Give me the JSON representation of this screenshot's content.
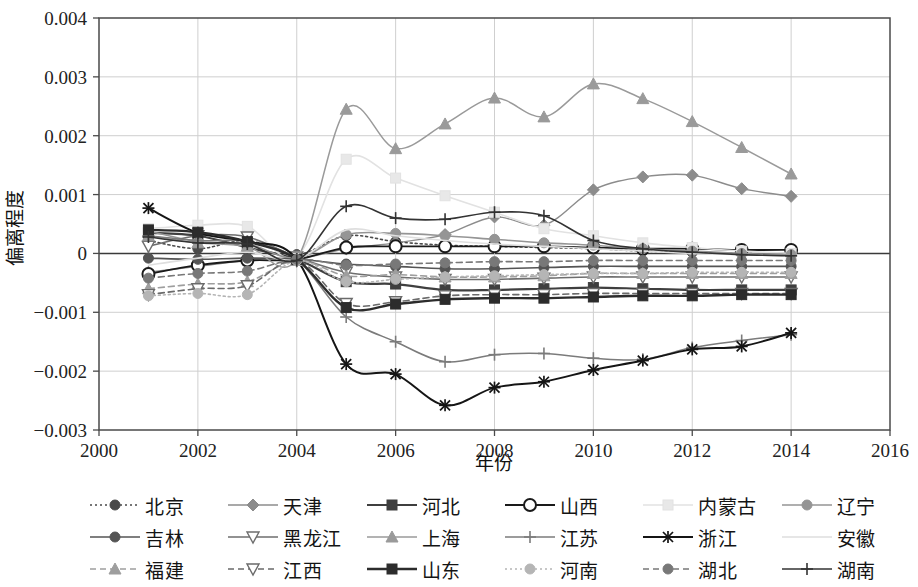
{
  "chart_data": {
    "type": "line",
    "title": "",
    "xlabel": "年份",
    "ylabel": "偏离程度",
    "xlim": [
      2000,
      2016
    ],
    "ylim": [
      -0.003,
      0.004
    ],
    "xticks": [
      "2000",
      "2002",
      "2004",
      "2006",
      "2008",
      "2010",
      "2012",
      "2014",
      "2016"
    ],
    "yticks": [
      "0.004",
      "0.003",
      "0.002",
      "0.001",
      "0",
      "-0.001",
      "-0.002",
      "-0.003"
    ],
    "grid": true,
    "legend_position": "bottom",
    "x": [
      2001,
      2002,
      2003,
      2004,
      2005,
      2006,
      2007,
      2008,
      2009,
      2010,
      2011,
      2012,
      2013,
      2014
    ],
    "series": [
      {
        "name": "北京",
        "color": "#4a4a4a",
        "dash": "2,3",
        "marker": "circle",
        "marker_fill": "#4a4a4a",
        "width": 1.6,
        "values": [
          0.00022,
          8e-05,
          0.00022,
          -2e-05,
          0.0003,
          0.0002,
          0.00014,
          0.00012,
          0.0001,
          8e-05,
          4e-05,
          2e-05,
          0.0,
          -2e-05
        ]
      },
      {
        "name": "天津",
        "color": "#8c8c8c",
        "dash": "none",
        "marker": "diamond",
        "marker_fill": "#8c8c8c",
        "width": 1.4,
        "values": [
          -0.00032,
          -0.00022,
          -0.00012,
          -0.0001,
          8e-05,
          0.00018,
          0.00032,
          0.00062,
          0.00048,
          0.00108,
          0.0013,
          0.00133,
          0.0011,
          0.00097
        ]
      },
      {
        "name": "河北",
        "color": "#3f3f3f",
        "dash": "none",
        "marker": "square",
        "marker_fill": "#3f3f3f",
        "width": 2.2,
        "values": [
          0.00035,
          0.0003,
          0.0001,
          -0.0001,
          -0.00048,
          -0.00052,
          -0.00062,
          -0.00062,
          -0.0006,
          -0.00058,
          -0.0006,
          -0.00062,
          -0.00062,
          -0.00062
        ]
      },
      {
        "name": "山西",
        "color": "#1a1a1a",
        "dash": "none",
        "marker": "circle-open",
        "marker_fill": "#ffffff",
        "width": 1.8,
        "values": [
          -0.00035,
          -0.0002,
          -0.00012,
          -0.0001,
          0.0001,
          0.00012,
          0.00012,
          0.00012,
          0.00012,
          0.0001,
          8e-05,
          8e-05,
          6e-05,
          6e-05
        ]
      },
      {
        "name": "内蒙古",
        "color": "#e2e2e2",
        "dash": "none",
        "marker": "square",
        "marker_fill": "#e8e8e8",
        "width": 1.6,
        "values": [
          0.00042,
          0.00048,
          0.00046,
          -5e-05,
          0.0016,
          0.00128,
          0.00098,
          0.0007,
          0.00042,
          0.0003,
          0.00018,
          0.0001,
          4e-05,
          0.0
        ]
      },
      {
        "name": "辽宁",
        "color": "#959595",
        "dash": "none",
        "marker": "circle",
        "marker_fill": "#959595",
        "width": 1.6,
        "values": [
          0.00038,
          0.0002,
          0.00016,
          -8e-05,
          0.00032,
          0.00034,
          0.0003,
          0.00024,
          0.00018,
          0.00014,
          8e-05,
          4e-05,
          0.0,
          -2e-05
        ]
      },
      {
        "name": "吉林",
        "color": "#545454",
        "dash": "none",
        "marker": "circle",
        "marker_fill": "#545454",
        "width": 1.6,
        "values": [
          -8e-05,
          -0.0001,
          -8e-05,
          -0.0001,
          -0.00018,
          -0.00022,
          -0.00026,
          -0.00026,
          -0.00024,
          -0.00022,
          -0.00022,
          -0.00022,
          -0.00022,
          -0.00022
        ]
      },
      {
        "name": "黑龙江",
        "color": "#6e6e6e",
        "dash": "none",
        "marker": "triangle-down-open",
        "marker_fill": "#ffffff",
        "width": 1.6,
        "values": [
          0.00012,
          0.0003,
          0.00028,
          -6e-05,
          -0.00032,
          -0.0004,
          -0.00044,
          -0.00044,
          -0.00042,
          -0.0004,
          -0.0004,
          -0.0004,
          -0.0004,
          -0.0004
        ]
      },
      {
        "name": "上海",
        "color": "#9a9a9a",
        "dash": "none",
        "marker": "triangle",
        "marker_fill": "#9a9a9a",
        "width": 1.5,
        "values": [
          0.0003,
          0.00018,
          0.00012,
          -0.0001,
          0.00245,
          0.00178,
          0.0022,
          0.00264,
          0.00232,
          0.00288,
          0.00263,
          0.00224,
          0.0018,
          0.00135
        ]
      },
      {
        "name": "江苏",
        "color": "#7b7b7b",
        "dash": "none",
        "marker": "plus",
        "marker_fill": "#7b7b7b",
        "width": 1.5,
        "values": [
          0.0003,
          0.00022,
          0.0002,
          -0.0001,
          -0.00108,
          -0.0015,
          -0.00184,
          -0.00172,
          -0.0017,
          -0.00178,
          -0.0018,
          -0.0016,
          -0.00148,
          -0.00138
        ]
      },
      {
        "name": "浙江",
        "color": "#151515",
        "dash": "none",
        "marker": "star",
        "marker_fill": "#151515",
        "width": 2.0,
        "values": [
          0.00077,
          0.00035,
          0.0002,
          -0.0001,
          -0.00188,
          -0.00205,
          -0.00258,
          -0.00228,
          -0.00218,
          -0.00198,
          -0.00182,
          -0.00163,
          -0.00158,
          -0.00135
        ]
      },
      {
        "name": "安徽",
        "color": "#dedede",
        "dash": "none",
        "marker": "none",
        "marker_fill": "#dedede",
        "width": 1.6,
        "values": [
          -0.0002,
          -8e-05,
          2e-05,
          -0.0001,
          0.0004,
          0.0003,
          0.00022,
          0.00016,
          0.00012,
          8e-05,
          4e-05,
          0.0,
          -2e-05,
          -4e-05
        ]
      },
      {
        "name": "福建",
        "color": "#9e9e9e",
        "dash": "6,4",
        "marker": "triangle",
        "marker_fill": "#9e9e9e",
        "width": 1.6,
        "values": [
          -0.0006,
          -0.00052,
          -0.00048,
          -0.00012,
          -0.00038,
          -0.00036,
          -0.0004,
          -0.0004,
          -0.00038,
          -0.00034,
          -0.00034,
          -0.00034,
          -0.00034,
          -0.00034
        ]
      },
      {
        "name": "江西",
        "color": "#6a6a6a",
        "dash": "6,4",
        "marker": "triangle-down-open",
        "marker_fill": "#ffffff",
        "width": 1.6,
        "values": [
          -0.0007,
          -0.0006,
          -0.00055,
          -0.00012,
          -0.00085,
          -0.00082,
          -0.00072,
          -0.0007,
          -0.0007,
          -0.00068,
          -0.00068,
          -0.00068,
          -0.00068,
          -0.00068
        ]
      },
      {
        "name": "山东",
        "color": "#2c2c2c",
        "dash": "none",
        "marker": "square",
        "marker_fill": "#2c2c2c",
        "width": 2.4,
        "values": [
          0.0004,
          0.00036,
          0.0002,
          -0.0001,
          -0.00092,
          -0.00086,
          -0.00078,
          -0.00076,
          -0.00076,
          -0.00074,
          -0.00072,
          -0.00072,
          -0.0007,
          -0.0007
        ]
      },
      {
        "name": "河南",
        "color": "#b5b5b5",
        "dash": "2,3",
        "marker": "circle",
        "marker_fill": "#b5b5b5",
        "width": 1.6,
        "values": [
          -0.00072,
          -0.00068,
          -0.0007,
          -0.00012,
          -0.00048,
          -0.00044,
          -0.0004,
          -0.00038,
          -0.00036,
          -0.00034,
          -0.00034,
          -0.00032,
          -0.00032,
          -0.00032
        ]
      },
      {
        "name": "湖北",
        "color": "#787878",
        "dash": "6,4",
        "marker": "circle",
        "marker_fill": "#787878",
        "width": 1.6,
        "values": [
          -0.00042,
          -0.00034,
          -0.0003,
          -0.0001,
          -0.0002,
          -0.00018,
          -0.00016,
          -0.00014,
          -0.00014,
          -0.00012,
          -0.00012,
          -0.00012,
          -0.00012,
          -0.00012
        ]
      },
      {
        "name": "湖南",
        "color": "#333333",
        "dash": "none",
        "marker": "plus",
        "marker_fill": "#333333",
        "width": 1.6,
        "values": [
          0.00028,
          0.00018,
          0.00016,
          -0.00012,
          0.0008,
          0.0006,
          0.00058,
          0.0007,
          0.00064,
          0.00022,
          8e-05,
          2e-05,
          -2e-05,
          -4e-05
        ]
      }
    ]
  },
  "axis": {
    "x_title": "年份",
    "y_title": "偏离程度"
  },
  "legend": {
    "items": [
      {
        "label": "北京"
      },
      {
        "label": "天津"
      },
      {
        "label": "河北"
      },
      {
        "label": "山西"
      },
      {
        "label": "内蒙古"
      },
      {
        "label": "辽宁"
      },
      {
        "label": "吉林"
      },
      {
        "label": "黑龙江"
      },
      {
        "label": "上海"
      },
      {
        "label": "江苏"
      },
      {
        "label": "浙江"
      },
      {
        "label": "安徽"
      },
      {
        "label": "福建"
      },
      {
        "label": "江西"
      },
      {
        "label": "山东"
      },
      {
        "label": "河南"
      },
      {
        "label": "湖北"
      },
      {
        "label": "湖南"
      }
    ]
  }
}
